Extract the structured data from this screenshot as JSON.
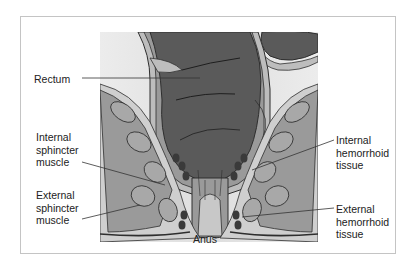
{
  "diagram": {
    "labels": {
      "rectum": "Rectum",
      "internal_sphincter": "Internal\nsphincter\nmuscle",
      "external_sphincter": "External\nsphincter\nmuscle",
      "internal_hemorrhoid": "Internal\nhemorrhoid\ntissue",
      "external_hemorrhoid": "External\nhemorrhoid\ntissue",
      "anus": "Anus"
    },
    "colors": {
      "frame_border": "#c4c4c4",
      "background_panel": "#e4e4e4",
      "rectum_dark": "#5a5a5a",
      "wall_light": "#bdbdbd",
      "muscle_mid": "#9a9a9a",
      "outline": "#2e2e2e",
      "vessel": "#3a3a3a"
    }
  }
}
